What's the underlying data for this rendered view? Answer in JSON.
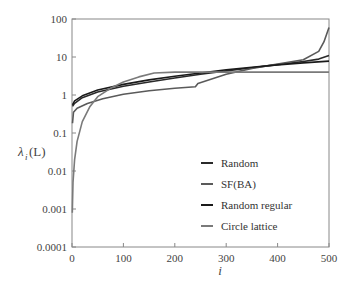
{
  "chart_data": {
    "type": "line",
    "title": "",
    "xlabel": "i",
    "ylabel": "λi(L)",
    "ylabel_main": "λ",
    "ylabel_sub": "i",
    "ylabel_arg": "(L)",
    "xlim": [
      0,
      500
    ],
    "ylim": [
      0.0001,
      100
    ],
    "yscale": "log",
    "grid": false,
    "legend_position": "lower right (inside)",
    "x_ticks": [
      "0",
      "100",
      "200",
      "300",
      "400",
      "500"
    ],
    "y_ticks": [
      "0.0001",
      "0.001",
      "0.01",
      "0.1",
      "1",
      "10",
      "100"
    ],
    "series": [
      {
        "name": "Random",
        "color": "#2a2a2a",
        "x": [
          1,
          5,
          20,
          50,
          100,
          150,
          200,
          250,
          300,
          350,
          400,
          450,
          480,
          500
        ],
        "values": [
          0.5,
          0.6,
          0.85,
          1.2,
          1.7,
          2.2,
          2.8,
          3.5,
          4.3,
          5.2,
          6.3,
          7.6,
          8.8,
          11
        ]
      },
      {
        "name": "SF(BA)",
        "color": "#5a5a5a",
        "x": [
          1,
          3,
          10,
          30,
          60,
          100,
          150,
          200,
          240,
          245,
          300,
          350,
          400,
          450,
          480,
          490,
          500
        ],
        "values": [
          0.18,
          0.35,
          0.45,
          0.6,
          0.8,
          1.05,
          1.3,
          1.5,
          1.65,
          2.0,
          3.5,
          5.0,
          6.5,
          8.5,
          14,
          25,
          60
        ]
      },
      {
        "name": "Random regular",
        "color": "#1a1a1a",
        "x": [
          1,
          5,
          20,
          50,
          100,
          150,
          200,
          250,
          300,
          350,
          400,
          450,
          500
        ],
        "values": [
          0.55,
          0.7,
          0.95,
          1.35,
          1.9,
          2.5,
          3.1,
          3.8,
          4.6,
          5.4,
          6.2,
          7.0,
          7.8
        ]
      },
      {
        "name": "Circle lattice",
        "color": "#7a7a7a",
        "x": [
          0.5,
          2,
          5,
          10,
          20,
          35,
          50,
          75,
          100,
          130,
          160,
          200,
          300,
          400,
          500
        ],
        "values": [
          0.0008,
          0.005,
          0.02,
          0.06,
          0.2,
          0.5,
          0.9,
          1.5,
          2.2,
          3.0,
          3.8,
          4.0,
          4.0,
          4.0,
          4.0
        ]
      }
    ]
  }
}
